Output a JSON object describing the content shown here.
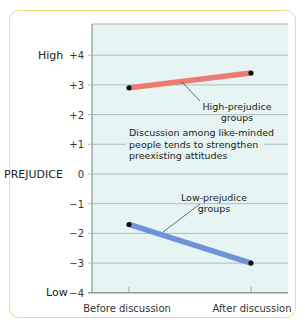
{
  "chart_data": {
    "type": "line",
    "title": "",
    "xlabel": "",
    "ylabel": "PREJUDICE",
    "ylim": [
      -4,
      4
    ],
    "categories": [
      "Before discussion",
      "After discussion"
    ],
    "y_ticks": [
      "+4",
      "+3",
      "+2",
      "+1",
      "0",
      "−1",
      "−2",
      "−3",
      "−4"
    ],
    "y_tick_values": [
      4,
      3,
      2,
      1,
      0,
      -1,
      -2,
      -3,
      -4
    ],
    "y_extreme_labels": {
      "high": "High",
      "low": "Low"
    },
    "grid": true,
    "series": [
      {
        "name": "High-prejudice groups",
        "values": [
          2.9,
          3.4
        ],
        "color": "#ee7b6f"
      },
      {
        "name": "Low-prejudice groups",
        "values": [
          -1.7,
          -3.0
        ],
        "color": "#6f93d8"
      }
    ],
    "annotations": [
      {
        "text_lines": [
          "High-prejudice",
          "groups"
        ],
        "target": "High-prejudice groups"
      },
      {
        "text_lines": [
          "Low-prejudice",
          "groups"
        ],
        "target": "Low-prejudice groups"
      },
      {
        "text_lines": [
          "Discussion among like-minded",
          "people tends to strengthen",
          "preexisting attitudes"
        ]
      }
    ]
  },
  "colors": {
    "plot_background": "#e6f4f3",
    "grid": "#a9b7b5",
    "frame_border": "#f3dc7a",
    "marker": "#111111"
  }
}
